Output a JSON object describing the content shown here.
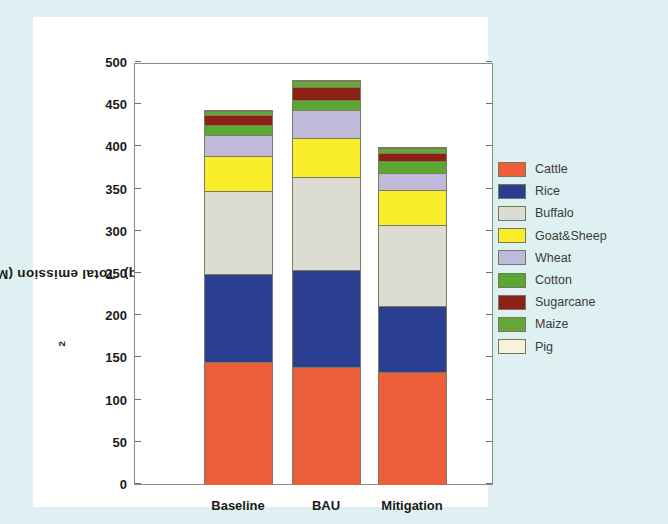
{
  "chart_data": {
    "type": "bar",
    "subtype": "stacked-bar",
    "title": "",
    "xlabel": "",
    "ylabel": "Total emission (MtCO2eq)",
    "ylabel_parts": {
      "pre": "Total emission (MtCO",
      "sub": "2",
      "post": "eq)"
    },
    "categories": [
      "Baseline",
      "BAU",
      "Mitigation"
    ],
    "ylim": [
      0,
      500
    ],
    "yticks": [
      0,
      50,
      100,
      150,
      200,
      250,
      300,
      350,
      400,
      450,
      500
    ],
    "ytick_labels": [
      "0",
      "50",
      "100",
      "150",
      "200",
      "250",
      "300",
      "350",
      "400",
      "450",
      "500"
    ],
    "grid": false,
    "legend_position": "right",
    "stack_order_bottom_to_top": [
      "Cattle",
      "Rice",
      "Buffalo",
      "Goat&Sheep",
      "Wheat",
      "Cotton",
      "Sugarcane",
      "Maize",
      "Pig"
    ],
    "series": [
      {
        "name": "Cattle",
        "color": "#ec5e3a",
        "values": [
          146,
          140,
          134
        ]
      },
      {
        "name": "Rice",
        "color": "#2a3f92",
        "values": [
          105,
          116,
          79
        ]
      },
      {
        "name": "Buffalo",
        "color": "#dcdcd2",
        "values": [
          100,
          111,
          98
        ]
      },
      {
        "name": "Goat&Sheep",
        "color": "#f9ec2a",
        "values": [
          42,
          48,
          42
        ]
      },
      {
        "name": "Wheat",
        "color": "#c0bada",
        "values": [
          27,
          34,
          22
        ]
      },
      {
        "name": "Cotton",
        "color": "#5aa832",
        "values": [
          12,
          13,
          15
        ]
      },
      {
        "name": "Sugarcane",
        "color": "#8b2116",
        "values": [
          13,
          17,
          11
        ]
      },
      {
        "name": "Maize",
        "color": "#66a63a",
        "values": [
          6,
          8,
          7
        ]
      },
      {
        "name": "Pig",
        "color": "#f7f2dd",
        "values": [
          1,
          1,
          1
        ]
      }
    ],
    "totals": [
      452,
      488,
      409
    ]
  },
  "legend": {
    "items": [
      {
        "label": "Cattle",
        "color": "#ec5e3a"
      },
      {
        "label": "Rice",
        "color": "#2a3f92"
      },
      {
        "label": "Buffalo",
        "color": "#dcdcd2"
      },
      {
        "label": "Goat&Sheep",
        "color": "#f9ec2a"
      },
      {
        "label": "Wheat",
        "color": "#c0bada"
      },
      {
        "label": "Cotton",
        "color": "#5aa832"
      },
      {
        "label": "Sugarcane",
        "color": "#8b2116"
      },
      {
        "label": "Maize",
        "color": "#66a63a"
      },
      {
        "label": "Pig",
        "color": "#f7f2dd"
      }
    ]
  },
  "colors": {
    "page_background": "#dff0f2",
    "figure_background": "#ffffff",
    "axis": "#8a8a8a",
    "text": "#1a1a1a"
  }
}
